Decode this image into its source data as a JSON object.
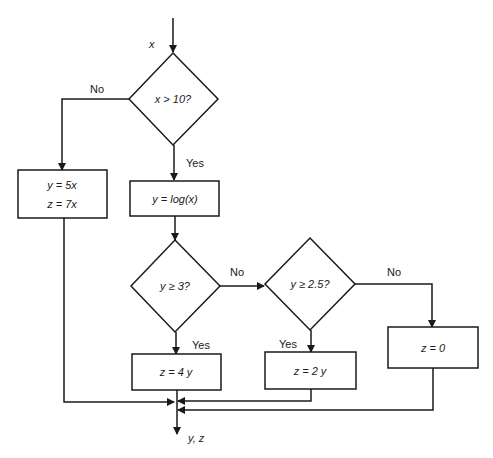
{
  "input": {
    "label": "x"
  },
  "decisions": [
    {
      "id": "d1",
      "text": "x > 10?",
      "yes": "Yes",
      "no": "No"
    },
    {
      "id": "d2",
      "text": "y ≥ 3?",
      "yes": "Yes",
      "no": "No"
    },
    {
      "id": "d3",
      "text": "y ≥ 2.5?",
      "yes": "Yes",
      "no": "No"
    }
  ],
  "processes": [
    {
      "id": "p1",
      "lines": [
        "y = 5x",
        "z = 7x"
      ]
    },
    {
      "id": "p2",
      "lines": [
        "y = log(x)"
      ]
    },
    {
      "id": "p3",
      "lines": [
        "z = 4 y"
      ]
    },
    {
      "id": "p4",
      "lines": [
        "z = 2 y"
      ]
    },
    {
      "id": "p5",
      "lines": [
        "z = 0"
      ]
    }
  ],
  "output": {
    "label": "y, z"
  }
}
